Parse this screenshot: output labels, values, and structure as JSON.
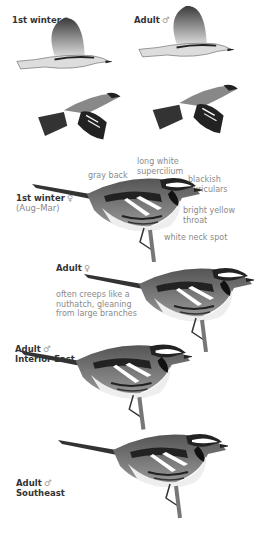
{
  "sections": {
    "flight": {
      "first_winter_female": {
        "label": "1st winter",
        "sex_symbol": "♀"
      },
      "adult_male": {
        "label": "Adult",
        "sex_symbol": "♂"
      }
    },
    "first_winter_perched": {
      "label": "1st winter",
      "sex_symbol": "♀",
      "sublabel": "(Aug–Mar)",
      "annotations": {
        "gray_back": "gray back",
        "supercilium": "long white\nsupercilium",
        "auriculars": "blackish\nauriculars",
        "throat": "bright yellow\nthroat",
        "neck_spot": "white neck spot"
      }
    },
    "adult_female": {
      "label": "Adult",
      "sex_symbol": "♀",
      "note": "often creeps like a\nnuthatch, gleaning\nfrom large branches"
    },
    "adult_male_interior": {
      "label": "Adult",
      "sex_symbol": "♂",
      "sublabel": "Interior East"
    },
    "adult_male_southeast": {
      "label": "Adult",
      "sex_symbol": "♂",
      "sublabel": "Southeast"
    }
  }
}
